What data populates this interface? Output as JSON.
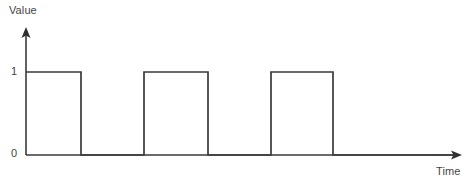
{
  "figure": {
    "background_color": "#ffffff",
    "line_color": "#3a3a3a",
    "text_color": "#444444",
    "width": 470,
    "height": 182
  },
  "axes": {
    "y_axis_label": "Value",
    "x_axis_label": "Time",
    "y_tick_labels": [
      "1",
      "0"
    ],
    "y_axis_arrow": "arrow-up",
    "x_axis_arrow": "arrow-right"
  },
  "chart_data": {
    "type": "line",
    "title": "",
    "xlabel": "Time",
    "ylabel": "Value",
    "grid": false,
    "legend": null,
    "ylim": [
      0,
      1
    ],
    "ytick_values": [
      0,
      1
    ],
    "ytick_labels": [
      "1",
      "0"
    ],
    "xtick_labels": [],
    "waveform": "square",
    "series": [
      {
        "name": "Value",
        "step": "post",
        "x": [
          0,
          55,
          118,
          182,
          245,
          307,
          436
        ],
        "y": [
          1,
          0,
          1,
          0,
          1,
          0,
          0
        ],
        "points": [
          {
            "x": 0,
            "y": 1
          },
          {
            "x": 55,
            "y": 1
          },
          {
            "x": 55,
            "y": 0
          },
          {
            "x": 118,
            "y": 0
          },
          {
            "x": 118,
            "y": 1
          },
          {
            "x": 182,
            "y": 1
          },
          {
            "x": 182,
            "y": 0
          },
          {
            "x": 245,
            "y": 0
          },
          {
            "x": 245,
            "y": 1
          },
          {
            "x": 307,
            "y": 1
          },
          {
            "x": 307,
            "y": 0
          },
          {
            "x": 436,
            "y": 0
          }
        ]
      }
    ],
    "pulses": [
      {
        "index": 1,
        "start": 0,
        "end": 55,
        "level": 1
      },
      {
        "index": 2,
        "start": 118,
        "end": 182,
        "level": 1
      },
      {
        "index": 3,
        "start": 245,
        "end": 307,
        "level": 1
      }
    ],
    "pulse_count": 3
  },
  "geometry": {
    "origin_x": 26,
    "baseline_y": 155,
    "high_y": 72,
    "y_axis_top": 28,
    "x_axis_right": 462,
    "edges_px": [
      26,
      81,
      144,
      208,
      271,
      333,
      456
    ],
    "levels": [
      1,
      0,
      1,
      0,
      1,
      0
    ]
  }
}
